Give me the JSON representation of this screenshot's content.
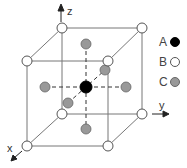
{
  "diagram": {
    "title": "",
    "axes": {
      "x_label": "x",
      "y_label": "y",
      "z_label": "z"
    },
    "legend": [
      {
        "key": "A",
        "label": "A",
        "color": "#000000",
        "site": "body-center"
      },
      {
        "key": "B",
        "label": "B",
        "color": "#ffffff",
        "site": "corner"
      },
      {
        "key": "C",
        "label": "C",
        "color": "#999999",
        "site": "face-center"
      }
    ],
    "colors": {
      "edge": "#777777",
      "dash": "#333333",
      "atom_A": "#000000",
      "atom_B": "#ffffff",
      "atom_C": "#999999",
      "atom_outline": "#555555"
    }
  }
}
